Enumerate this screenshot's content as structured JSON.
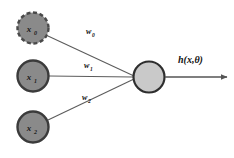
{
  "diagram": {
    "type": "neural-network-single-neuron",
    "background_color": "#ffffff",
    "edge_color": "#5a5a5a",
    "input_nodes": [
      {
        "id": "x0",
        "label": "x",
        "subscript": "0",
        "border_style": "dashed",
        "fill_color": "#8a8a8a",
        "stroke_color": "#4a4a4a",
        "cx": 33,
        "cy": 28,
        "r": 16
      },
      {
        "id": "x1",
        "label": "x",
        "subscript": "1",
        "border_style": "solid",
        "fill_color": "#8a8a8a",
        "stroke_color": "#3b3b3b",
        "cx": 33,
        "cy": 76,
        "r": 16
      },
      {
        "id": "x2",
        "label": "x",
        "subscript": "2",
        "border_style": "solid",
        "fill_color": "#8a8a8a",
        "stroke_color": "#3b3b3b",
        "cx": 33,
        "cy": 127,
        "r": 16
      }
    ],
    "weights": [
      {
        "id": "w0",
        "label": "w",
        "subscript": "0",
        "x": 86,
        "y": 34
      },
      {
        "id": "w1",
        "label": "w",
        "subscript": "1",
        "x": 84,
        "y": 68
      },
      {
        "id": "w2",
        "label": "w",
        "subscript": "2",
        "x": 82,
        "y": 100
      }
    ],
    "output_node": {
      "id": "neuron",
      "fill_color": "#c9c9c9",
      "stroke_color": "#2e2e2e",
      "cx": 149,
      "cy": 77,
      "r": 16
    },
    "output": {
      "label": "h(x,θ)",
      "label_x": 178,
      "label_y": 62,
      "arrow_start_x": 165,
      "arrow_end_x": 228,
      "arrow_y": 77
    }
  }
}
